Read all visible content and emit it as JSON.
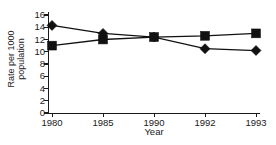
{
  "chart_data": {
    "type": "line",
    "title": "",
    "xlabel": "Year",
    "ylabel": "Rate per 1000 population",
    "ylabel_line1": "Rate per 1000",
    "ylabel_line2": "population",
    "categories": [
      "1980",
      "1985",
      "1990",
      "1992",
      "1993"
    ],
    "ylim": [
      0,
      16
    ],
    "yticks": [
      0,
      2,
      4,
      6,
      8,
      10,
      12,
      14,
      16
    ],
    "ytick_labels": [
      "0",
      "2",
      "4",
      "6",
      "8",
      "10",
      "12",
      "14",
      "16"
    ],
    "grid": false,
    "legend": "none",
    "series": [
      {
        "name": "series-diamond",
        "marker": "diamond",
        "color": "#111111",
        "values": [
          14.3,
          13.0,
          12.4,
          10.5,
          10.2
        ]
      },
      {
        "name": "series-square",
        "marker": "square",
        "color": "#111111",
        "values": [
          11.0,
          12.0,
          12.4,
          12.6,
          13.0
        ]
      }
    ]
  },
  "colors": {
    "ink": "#111111",
    "axis": "#1a1a1a",
    "background": "#ffffff"
  }
}
